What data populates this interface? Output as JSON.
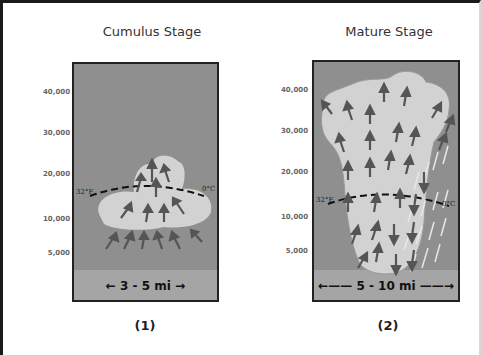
{
  "stages": [
    {
      "title": "Cumulus Stage",
      "width_label": "← 3 - 5 mi →",
      "caption": "(1)",
      "altitudes": [
        "40,000",
        "30,000",
        "20,000",
        "10,000",
        "5,000"
      ],
      "freezing_left": "32°F",
      "freezing_right": "0°C"
    },
    {
      "title": "Mature Stage",
      "width_label": "←—— 5 - 10 mi ——→",
      "caption": "(2)",
      "altitudes": [
        "40,000",
        "30,000",
        "20,000",
        "10,000",
        "5,000"
      ],
      "freezing_left": "32°F",
      "freezing_right": "0°C"
    }
  ],
  "colors": {
    "sky": "#8f8f8f",
    "ground": "#a5a5a5",
    "cloud": "#d2d2d2",
    "arrow": "#555555",
    "rain": "#e8e8e8"
  }
}
